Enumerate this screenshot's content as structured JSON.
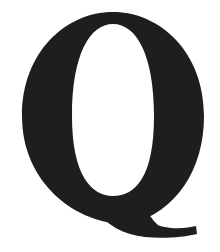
{
  "glyph": {
    "character": "Q",
    "description": "Large bold serif capital letter Q",
    "color": "#1e1e1e",
    "background": "#ffffff"
  }
}
